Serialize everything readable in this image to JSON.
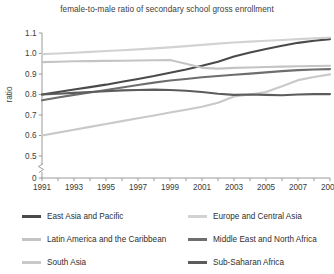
{
  "chart_data": {
    "type": "line",
    "title": "female-to-male ratio of secondary school gross enrollment",
    "xlabel": "",
    "ylabel": "ratio",
    "x": [
      1991,
      1992,
      1993,
      1994,
      1995,
      1996,
      1997,
      1998,
      1999,
      2000,
      2001,
      2002,
      2003,
      2004,
      2005,
      2006,
      2007,
      2008,
      2009
    ],
    "xticks": [
      "1991",
      "1993",
      "1995",
      "1997",
      "1999",
      "2001",
      "2003",
      "2005",
      "2007",
      "2009"
    ],
    "yticks": [
      "0",
      "0.5",
      "0.6",
      "0.7",
      "0.8",
      "0.9",
      "1.0",
      "1.1"
    ],
    "ylim": [
      0.45,
      1.13
    ],
    "axis_break": true,
    "grid": false,
    "legend_position": "bottom",
    "series": [
      {
        "name": "East Asia and Pacific",
        "color": "#4a4a4a",
        "width": 2.1,
        "values": [
          0.8,
          0.812,
          0.824,
          0.836,
          0.848,
          0.862,
          0.876,
          0.89,
          0.906,
          0.922,
          0.94,
          0.96,
          0.985,
          1.005,
          1.022,
          1.038,
          1.052,
          1.062,
          1.07
        ]
      },
      {
        "name": "Europe and Central Asia",
        "color": "#d2d2d2",
        "width": 2.1,
        "values": [
          0.997,
          1.0,
          1.004,
          1.008,
          1.012,
          1.016,
          1.02,
          1.025,
          1.03,
          1.036,
          1.042,
          1.048,
          1.054,
          1.058,
          1.062,
          1.066,
          1.07,
          1.074,
          1.078
        ]
      },
      {
        "name": "Latin America and the Caribbean",
        "color": "#c4c4c4",
        "width": 2.1,
        "values": [
          0.958,
          0.96,
          0.962,
          0.963,
          0.964,
          0.965,
          0.966,
          0.967,
          0.968,
          0.95,
          0.93,
          0.926,
          0.93,
          0.932,
          0.934,
          0.936,
          0.938,
          0.939,
          0.94
        ]
      },
      {
        "name": "Middle East and North Africa",
        "color": "#6e6e6e",
        "width": 2.1,
        "values": [
          0.772,
          0.785,
          0.798,
          0.81,
          0.822,
          0.834,
          0.846,
          0.858,
          0.868,
          0.876,
          0.884,
          0.89,
          0.896,
          0.902,
          0.908,
          0.914,
          0.919,
          0.922,
          0.924
        ]
      },
      {
        "name": "South Asia",
        "color": "#c9c9c9",
        "width": 2.1,
        "values": [
          0.6,
          0.614,
          0.628,
          0.642,
          0.656,
          0.67,
          0.684,
          0.698,
          0.712,
          0.726,
          0.74,
          0.76,
          0.79,
          0.8,
          0.812,
          0.84,
          0.87,
          0.885,
          0.898
        ]
      },
      {
        "name": "Sub-Saharan Africa",
        "color": "#5c5c5c",
        "width": 2.1,
        "values": [
          0.8,
          0.804,
          0.808,
          0.812,
          0.816,
          0.82,
          0.822,
          0.824,
          0.822,
          0.818,
          0.812,
          0.804,
          0.798,
          0.8,
          0.798,
          0.796,
          0.8,
          0.802,
          0.802
        ]
      }
    ]
  },
  "legend": {
    "left": [
      {
        "label": "East Asia and Pacific",
        "color": "#4a4a4a"
      },
      {
        "label": "Latin America and the Caribbean",
        "color": "#c4c4c4"
      },
      {
        "label": "South Asia",
        "color": "#c9c9c9"
      }
    ],
    "right": [
      {
        "label": "Europe and Central Asia",
        "color": "#d2d2d2"
      },
      {
        "label": "Middle East and North Africa",
        "color": "#6e6e6e"
      },
      {
        "label": "Sub-Saharan Africa",
        "color": "#5c5c5c"
      }
    ]
  }
}
